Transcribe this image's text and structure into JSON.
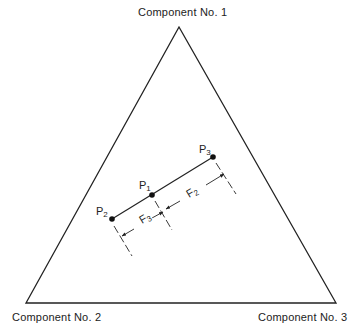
{
  "diagram": {
    "type": "ternary-composition-diagram",
    "vertices": [
      {
        "id": "apex",
        "label": "Component No. 1"
      },
      {
        "id": "left",
        "label": "Component No. 2"
      },
      {
        "id": "right",
        "label": "Component No. 3"
      }
    ],
    "points": [
      {
        "id": "P1",
        "base": "P",
        "sub": "1"
      },
      {
        "id": "P2",
        "base": "P",
        "sub": "2"
      },
      {
        "id": "P3",
        "base": "P",
        "sub": "3"
      }
    ],
    "dimensions": [
      {
        "id": "F3",
        "base": "F",
        "sub": "3",
        "between": [
          "P2",
          "P1"
        ]
      },
      {
        "id": "F2",
        "base": "F",
        "sub": "2",
        "between": [
          "P1",
          "P3"
        ]
      }
    ],
    "colors": {
      "line": "#222222",
      "background": "#ffffff"
    }
  }
}
